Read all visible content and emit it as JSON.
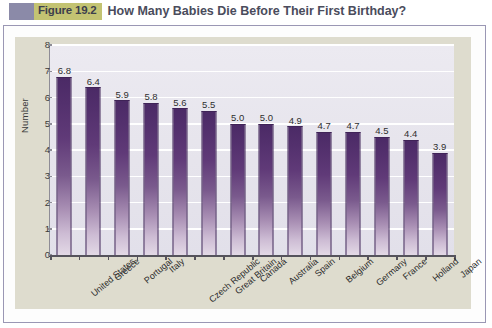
{
  "figure": {
    "badge_label": "Figure 19.2",
    "title": "How Many Babies Die Before Their First Birthday?",
    "badge_bg": "#c3c372",
    "swatch_color": "#8b8aa8",
    "title_color": "#4a4c5c",
    "card_border": "#9a97b4",
    "panel_bg": "#dedcce"
  },
  "chart_data": {
    "type": "bar",
    "title": "How Many Babies Die Before Their First Birthday?",
    "subtitle": "",
    "xlabel": "",
    "ylabel": "Number",
    "ylim": [
      0,
      8
    ],
    "yticks": [
      0,
      1,
      2,
      3,
      4,
      5,
      6,
      7,
      8
    ],
    "ytick_labels": [
      "0",
      "1",
      "2",
      "3",
      "4",
      "5",
      "6",
      "7",
      "8"
    ],
    "grid": true,
    "grid_color": "#ffffff",
    "legend": false,
    "legend_position": "none",
    "bar_color": "#5a3272",
    "bar_gradient": [
      "#4b2a66",
      "#e3d9e6"
    ],
    "plot_bg": "#e8e6ee",
    "categories": [
      "United States",
      "Greece",
      "Portugal",
      "Italy",
      "Czech Republic",
      "Great Britain",
      "Canada",
      "Australia",
      "Spain",
      "Belgium",
      "Germany",
      "France",
      "Holland",
      "Japan"
    ],
    "values": [
      6.8,
      6.4,
      5.9,
      5.8,
      5.6,
      5.5,
      5.0,
      5.0,
      4.9,
      4.7,
      4.7,
      4.5,
      4.4,
      3.9
    ],
    "value_labels": [
      "6.8",
      "6.4",
      "5.9",
      "5.8",
      "5.6",
      "5.5",
      "5.0",
      "5.0",
      "4.9",
      "4.7",
      "4.7",
      "4.5",
      "4.4",
      "3.9"
    ]
  }
}
